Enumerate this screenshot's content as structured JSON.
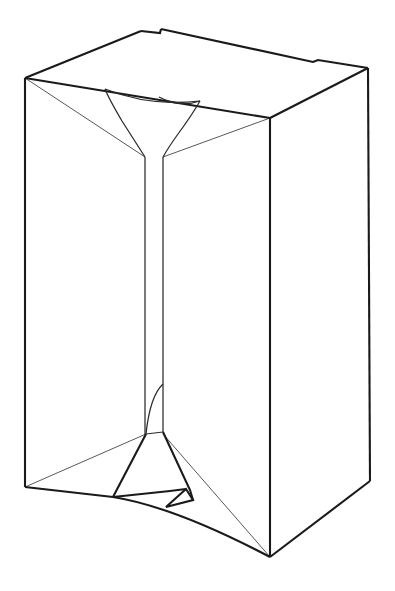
{
  "figure": {
    "title": "Line drawing of a rectangular carton with internal gusset funnel",
    "domain": "Diagram",
    "canvas": {
      "width": 395,
      "height": 591,
      "background": "#ffffff"
    },
    "stroke_colors": {
      "major_edge": "#1a1a1a",
      "minor_edge": "#2b2b2b",
      "hairline_edge": "#3a3a3a",
      "face": "#ffffff"
    },
    "view": "three-quarter isometric, viewed from slightly above",
    "parts": [
      {
        "id": "top-panel",
        "label": "top panel",
        "description": "parallelogram top face of the carton with a small step notch on the rear edge"
      },
      {
        "id": "left-face",
        "label": "left side panel",
        "description": "tall quadrilateral face on the left"
      },
      {
        "id": "right-face",
        "label": "right side panel",
        "description": "tall quadrilateral face on the right"
      },
      {
        "id": "upper-gusset",
        "label": "upper gusset funnel",
        "description": "inverted triangular funnel converging to the central spine at the top"
      },
      {
        "id": "center-spine",
        "label": "center spine",
        "description": "narrow vertical band running the full height of the interior"
      },
      {
        "id": "lower-gusset",
        "label": "lower gusset funnel",
        "description": "flared trapezoidal base fold with a small triangular tuck notch"
      }
    ],
    "vertices": {
      "top_rear_peak": [
        141,
        31
      ],
      "top_notch_a": [
        160,
        33
      ],
      "top_notch_b": [
        161,
        29
      ],
      "top_left": [
        25,
        78
      ],
      "top_right": [
        368,
        68
      ],
      "right_notch_a": [
        313,
        62
      ],
      "right_notch_b": [
        318,
        60
      ],
      "front_top": [
        270,
        118
      ],
      "bottom_left": [
        25,
        487
      ],
      "front_bottom": [
        270,
        557
      ],
      "bottom_right": [
        370,
        481
      ],
      "spine_left_x": 145,
      "spine_right_x": 163,
      "spine_top_y": 157,
      "spine_bottom_y": 432
    },
    "counts": {
      "visible_faces": 3,
      "gussets": 2,
      "notches": 3
    }
  }
}
